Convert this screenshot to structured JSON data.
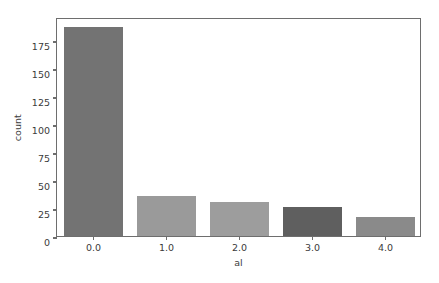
{
  "chart_data": {
    "type": "bar",
    "title": "",
    "xlabel": "al",
    "ylabel": "count",
    "categories": [
      "0.0",
      "1.0",
      "2.0",
      "3.0",
      "4.0"
    ],
    "values": [
      187,
      36,
      30,
      26,
      17
    ],
    "bar_colors": [
      "#737373",
      "#9a9a9a",
      "#9d9d9d",
      "#5f5f5f",
      "#8a8a8a"
    ],
    "xlim": [
      -0.5,
      4.5
    ],
    "ylim": [
      0,
      195.5
    ],
    "xticks": [
      "0.0",
      "1.0",
      "2.0",
      "3.0",
      "4.0"
    ],
    "yticks": [
      "0",
      "25",
      "50",
      "75",
      "100",
      "125",
      "150",
      "175"
    ],
    "ytick_values": [
      0,
      25,
      50,
      75,
      100,
      125,
      150,
      175
    ],
    "grid": false,
    "legend": null,
    "spines": [
      "left",
      "right",
      "top",
      "bottom"
    ],
    "background": "#ffffff",
    "axis_color": "#6e6e6e",
    "text_color": "#3b3b3b"
  }
}
